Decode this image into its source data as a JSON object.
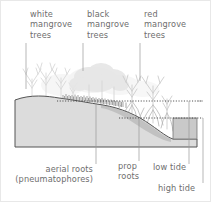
{
  "figure": {
    "kind": "mangrove-zonation-cross-section",
    "background_color": "#ffffff",
    "ground_fill": "#dcdcdc",
    "ground_stroke": "#555555",
    "water_fill": "#c9c9c9",
    "tree_color": "#e2e2e2",
    "tree_stroke": "#cfcfcf",
    "dark_vegetation": "#8f8f8f",
    "label_color": "#6e6e6e",
    "leader_color": "#9a9a9a",
    "tide_line_color": "#3a3a3a"
  },
  "top_labels": [
    {
      "id": "white-mangrove",
      "text": "white\nmangrove\ntrees"
    },
    {
      "id": "black-mangrove",
      "text": "black\nmangrove\ntrees"
    },
    {
      "id": "red-mangrove",
      "text": "red\nmangrove\ntrees"
    }
  ],
  "bottom_labels": [
    {
      "id": "aerial-roots",
      "text": "aerial roots\n(pneumatophores)"
    },
    {
      "id": "prop-roots",
      "text": "prop\nroots"
    },
    {
      "id": "low-tide",
      "text": "low tide"
    },
    {
      "id": "high-tide",
      "text": "high tide"
    }
  ],
  "tide_lines": [
    {
      "id": "high-tide-line",
      "label": "high tide",
      "y": 100
    },
    {
      "id": "low-tide-line",
      "label": "low tide",
      "y": 117
    }
  ]
}
